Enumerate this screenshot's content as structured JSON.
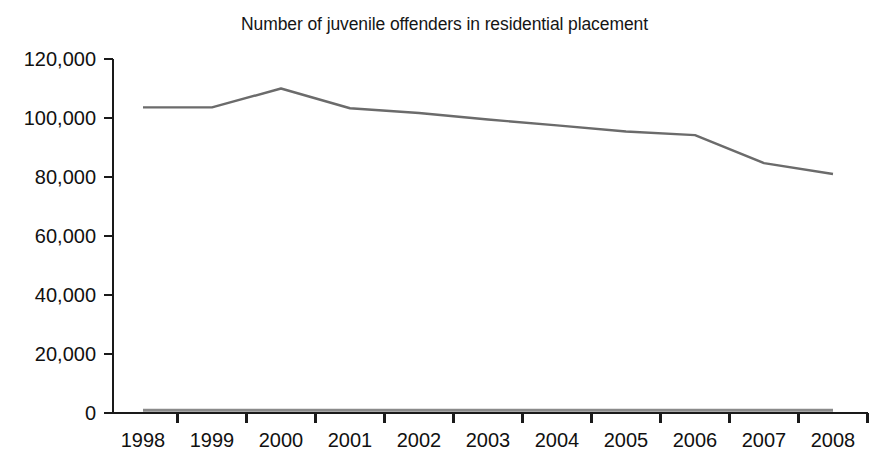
{
  "chart_data": {
    "type": "line",
    "title": "Number of juvenile offenders in residential placement",
    "xlabel": "",
    "ylabel": "",
    "categories": [
      "1998",
      "1999",
      "2000",
      "2001",
      "2002",
      "2003",
      "2004",
      "2005",
      "2006",
      "2007",
      "2008"
    ],
    "x": [
      1998,
      1999,
      2000,
      2001,
      2002,
      2003,
      2004,
      2005,
      2006,
      2007,
      2008
    ],
    "series": [
      {
        "name": "Juvenile offenders in residential placement",
        "color": "#6b6b6b",
        "values": [
          103600,
          103600,
          110000,
          103300,
          101700,
          99500,
          97500,
          95400,
          94200,
          84700,
          81000
        ]
      },
      {
        "name": "Baseline series",
        "color": "#8a8a8a",
        "values": [
          900,
          900,
          900,
          900,
          900,
          900,
          900,
          900,
          900,
          900,
          900
        ]
      }
    ],
    "ylim": [
      0,
      120000
    ],
    "yticks": [
      0,
      20000,
      40000,
      60000,
      80000,
      100000,
      120000
    ],
    "ytick_labels": [
      "0",
      "20,000",
      "40,000",
      "60,000",
      "80,000",
      "100,000",
      "120,000"
    ],
    "xtick_labels": [
      "1998",
      "1999",
      "2000",
      "2001",
      "2002",
      "2003",
      "2004",
      "2005",
      "2006",
      "2007",
      "2008"
    ],
    "grid": false,
    "legend": "none",
    "axis_color": "#1a1a1a"
  }
}
